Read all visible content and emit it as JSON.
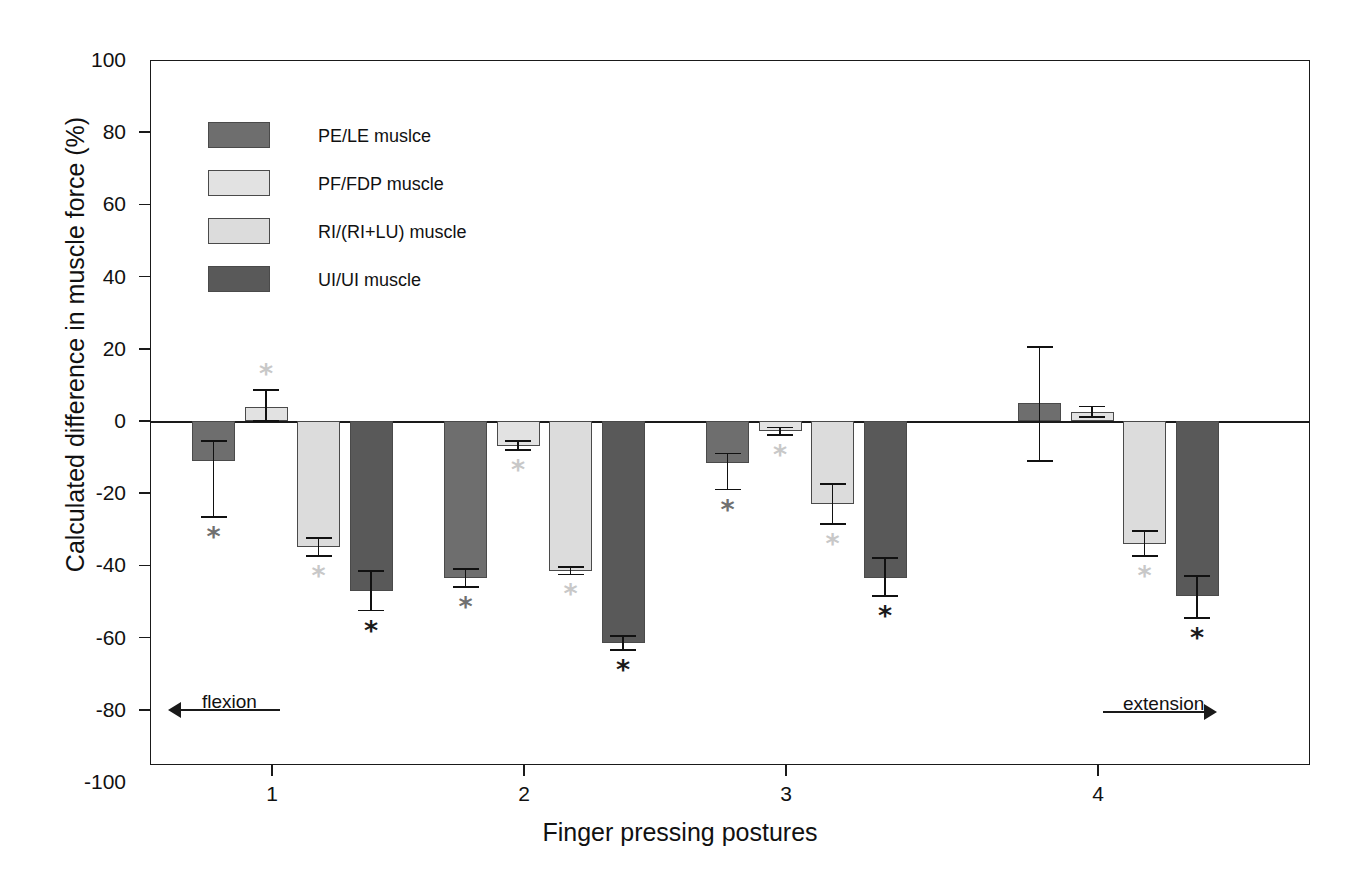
{
  "chart_data": {
    "type": "bar",
    "title": "",
    "xlabel": "Finger pressing postures",
    "ylabel": "Calculated difference in muscle force (%)",
    "ylim": [
      -100,
      100
    ],
    "yticks": [
      100,
      80,
      60,
      40,
      20,
      0,
      -20,
      -40,
      -60,
      -80,
      -100
    ],
    "ytick_labels": [
      "100",
      "80",
      "60",
      "40",
      "20",
      "0",
      "-20",
      "-40",
      "-60",
      "-80",
      "-100"
    ],
    "categories": [
      "1",
      "2",
      "3",
      "4"
    ],
    "xtick_labels": [
      "1",
      "2",
      "3",
      "4"
    ],
    "grid": false,
    "legend_position": "upper left",
    "series": [
      {
        "name": "PE/LE muslce",
        "color": "#6e6e6e",
        "values": [
          -11,
          -43.5,
          -11.5,
          5
        ],
        "err_up": [
          5.5,
          2.5,
          2.5,
          15.5
        ],
        "err_down": [
          15.5,
          2.5,
          7.5,
          16
        ],
        "significant": [
          true,
          true,
          true,
          false
        ]
      },
      {
        "name": "PF/FDP muscle",
        "color": "#e2e2e2",
        "values": [
          4,
          -6.8,
          -2.8,
          2.5
        ],
        "err_up": [
          4.5,
          1.2,
          1.0,
          1.5
        ],
        "err_down": [
          4.0,
          1.2,
          1.0,
          1.5
        ],
        "significant": [
          true,
          true,
          true,
          false
        ]
      },
      {
        "name": "RI/(RI+LU) muscle",
        "color": "#dcdcdc",
        "values": [
          -35,
          -41.5,
          -23,
          -34
        ],
        "err_up": [
          2.5,
          1.0,
          5.5,
          3.5
        ],
        "err_down": [
          2.5,
          1.0,
          5.5,
          3.5
        ],
        "significant": [
          true,
          true,
          true,
          true
        ]
      },
      {
        "name": "UI/UI muscle",
        "color": "#595959",
        "values": [
          -47,
          -61.5,
          -43.5,
          -48.5
        ],
        "err_up": [
          5.5,
          2.0,
          5.5,
          5.5
        ],
        "err_down": [
          5.5,
          2.0,
          5.0,
          6.0
        ],
        "significant": [
          true,
          true,
          true,
          true
        ]
      }
    ],
    "annotations": [
      {
        "text": "flexion",
        "direction": "left",
        "value": "1"
      },
      {
        "text": "extension",
        "direction": "right",
        "value": "4"
      }
    ],
    "significance_marker": "*"
  },
  "legend": {
    "items": [
      {
        "label": "PE/LE muslce"
      },
      {
        "label": "PF/FDP muscle"
      },
      {
        "label": "RI/(RI+LU) muscle"
      },
      {
        "label": "UI/UI muscle"
      }
    ]
  },
  "axes": {
    "y_title": "Calculated difference in muscle force (%)",
    "x_title": "Finger pressing postures",
    "y_ticks": [
      "100",
      "80",
      "60",
      "40",
      "20",
      "0",
      "-20",
      "-40",
      "-60",
      "-80",
      "-100"
    ],
    "x_ticks": [
      "1",
      "2",
      "3",
      "4"
    ]
  },
  "annotations": {
    "flexion": "flexion",
    "extension": "extension"
  }
}
